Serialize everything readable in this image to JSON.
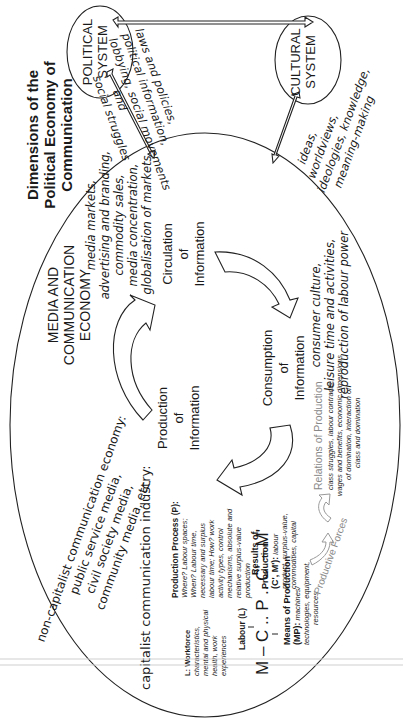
{
  "title": [
    "Dimensions of the",
    "Political Economy of",
    "Communication"
  ],
  "political_system": [
    "POLITICAL",
    "SYSTEM"
  ],
  "cultural_system": [
    "CULTURAL",
    "SYSTEM"
  ],
  "political_links": [
    "laws and policies,",
    "political information,",
    "lobbying, social movements",
    "and",
    "social struggles"
  ],
  "cultural_links": [
    "ideas,",
    "worldviews,",
    "ideologies, knowledge,",
    "meaning-making"
  ],
  "economy_label": [
    "MEDIA AND",
    "COMMUNICATION",
    "ECONOMY"
  ],
  "circulation": {
    "label": [
      "Circulation",
      "of",
      "Information"
    ],
    "details": [
      "media markets,",
      "advertising and branding,",
      "commodity sales,",
      "media concentration,",
      "globalisation of markets"
    ]
  },
  "consumption": {
    "label": [
      "Consumption",
      "of",
      "Information"
    ],
    "details": [
      "consumer culture,",
      "leisure time and activities,",
      "reproduction of labour power"
    ]
  },
  "production": {
    "label": [
      "Production",
      "of",
      "Information"
    ]
  },
  "non_capitalist": [
    "non-capitalist communication economy:",
    "public service media,",
    "civil society media,",
    "community media, etc."
  ],
  "capitalist_industry": "capitalist communication industry:",
  "workforce": [
    "L: Workforce",
    "characteristics,",
    "mental and physical",
    "health, work",
    "experiences"
  ],
  "labour": "Labour (L)",
  "circuit_formula": "M – C .. P .. C' – M'",
  "production_process": {
    "heading": "Production Process (P):",
    "lines": [
      "Where? Labour spaces;",
      "When? Labour time,",
      "necessary and surplus",
      "labour time; How? work",
      "activity types, control",
      "mechanisms, absolute and",
      "relative surplus-value",
      "production"
    ]
  },
  "results": {
    "heading": [
      "Results of",
      "Production",
      "(C', M'):"
    ],
    "lines": [
      "labour",
      "product, surplus-value,",
      "commodities, capital"
    ]
  },
  "means": {
    "heading": [
      "Means of Production",
      "(MP):"
    ],
    "lines": [
      "machines/",
      "technologies, equipment,",
      "resources"
    ]
  },
  "productive_forces": "Productive Forces",
  "relations": {
    "heading": "Relations of Production",
    "lines": [
      "class struggles, labour contracts,",
      "wages and benefits, economic dimensions",
      "of domination, interaction of",
      "class and domination"
    ]
  }
}
